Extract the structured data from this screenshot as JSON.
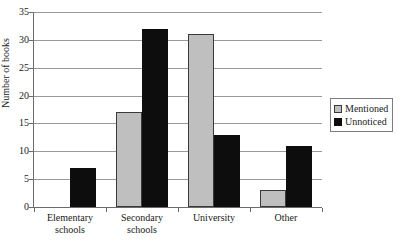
{
  "chart_data": {
    "type": "bar",
    "title": "",
    "xlabel": "",
    "ylabel": "Number of books",
    "categories": [
      "Elementary\nschools",
      "Secondary\nschools",
      "University",
      "Other"
    ],
    "series": [
      {
        "name": "Mentioned",
        "values": [
          0,
          17,
          31,
          3
        ],
        "color": "#bfbfbf"
      },
      {
        "name": "Unnoticed",
        "values": [
          7,
          32,
          13,
          11
        ],
        "color": "#0d0d0d"
      }
    ],
    "ylim": [
      0,
      35
    ],
    "ytick_values": [
      0,
      5,
      10,
      15,
      20,
      25,
      30,
      35
    ],
    "ytick_labels": [
      "0",
      "5",
      "10",
      "15",
      "20",
      "25",
      "30",
      "35"
    ],
    "grid": true,
    "legend_position": "right"
  },
  "legend": {
    "items": [
      {
        "label": "Mentioned"
      },
      {
        "label": "Unnoticed"
      }
    ]
  },
  "title_remnant": "",
  "colors": {
    "mentioned": "#bfbfbf",
    "unnoticed": "#0d0d0d",
    "gridline": "#9a9a9a",
    "axis": "#6b6b6b",
    "text": "#1a1a1a",
    "background": "#ffffff"
  }
}
